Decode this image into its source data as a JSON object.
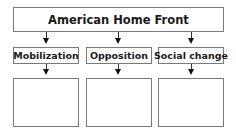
{
  "diagram": {
    "root": {
      "label": "American Home Front"
    },
    "categories": [
      {
        "label": "Mobilization",
        "detail": ""
      },
      {
        "label": "Opposition",
        "detail": ""
      },
      {
        "label": "Social change",
        "detail": ""
      }
    ],
    "colors": {
      "border": "#7a7a7a",
      "arrow": "#111111",
      "text": "#1a1a1a"
    }
  }
}
